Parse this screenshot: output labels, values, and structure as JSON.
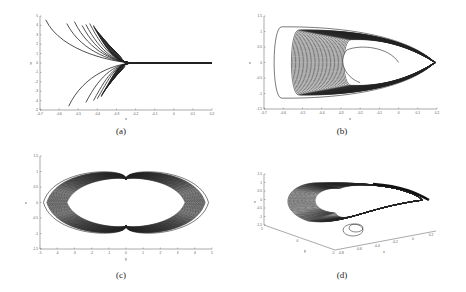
{
  "chart_data": [
    {
      "id": "a",
      "type": "line",
      "caption": "(a)",
      "title": "",
      "xlabel": "x",
      "ylabel": "y",
      "xlim": [
        -0.7,
        0.2
      ],
      "ylim": [
        -5,
        5
      ],
      "xticks": [
        "-0.7",
        "-0.6",
        "-0.5",
        "-0.4",
        "-0.3",
        "-0.2",
        "-0.1",
        "0",
        "0.1",
        "0.2"
      ],
      "yticks": [
        "5",
        "4",
        "3",
        "2",
        "1",
        "0",
        "-1",
        "-2",
        "-3",
        "-4",
        "-5"
      ],
      "grid": false,
      "description": "Family of trajectories in x-y plane converging from the left onto y=0 near x≈-0.2 and continuing flat to x=0.2",
      "series": [
        {
          "name": "upper trajectories",
          "x_start": [
            -0.67,
            -0.56,
            -0.52,
            -0.48,
            -0.46,
            -0.44,
            -0.42
          ],
          "y_start": [
            4.6,
            4.2,
            4.4,
            4.0,
            4.1,
            4.2,
            4.0
          ],
          "x_end": 0.2,
          "y_end": 0
        },
        {
          "name": "lower trajectories",
          "x_start": [
            -0.55,
            -0.46,
            -0.42,
            -0.4,
            -0.38
          ],
          "y_start": [
            -4.6,
            -4.2,
            -4.0,
            -3.8,
            -3.6
          ],
          "x_end": 0.2,
          "y_end": 0
        }
      ]
    },
    {
      "id": "b",
      "type": "line",
      "caption": "(b)",
      "title": "",
      "xlabel": "x",
      "ylabel": "z",
      "xlim": [
        -0.7,
        0.2
      ],
      "ylim": [
        -1.5,
        1.5
      ],
      "xticks": [
        "-0.7",
        "-0.6",
        "-0.5",
        "-0.4",
        "-0.3",
        "-0.2",
        "-0.1",
        "0",
        "0.1",
        "0.2"
      ],
      "yticks": [
        "1.5",
        "1",
        "0.5",
        "0",
        "-0.5",
        "-1",
        "-1.5"
      ],
      "grid": false,
      "description": "x-z projection of a chaotic attractor: nested loops extending from x≈-0.65 to tip at x≈0.2, z in [-1.1,1.1], hollow core from x≈-0.3 to 0",
      "series": [
        {
          "name": "attractor",
          "x_range": [
            -0.65,
            0.19
          ],
          "z_range": [
            -1.1,
            1.1
          ],
          "hole_x_range": [
            -0.28,
            0.0
          ]
        }
      ]
    },
    {
      "id": "c",
      "type": "line",
      "caption": "(c)",
      "title": "",
      "xlabel": "y",
      "ylabel": "z",
      "xlim": [
        -5,
        5
      ],
      "ylim": [
        -1.5,
        1.5
      ],
      "xticks": [
        "-5",
        "-4",
        "-3",
        "-2",
        "-1",
        "0",
        "1",
        "2",
        "3",
        "4",
        "5"
      ],
      "yticks": [
        "1.5",
        "1",
        "0.5",
        "0",
        "-0.5",
        "-1",
        "-1.5"
      ],
      "grid": false,
      "description": "y-z projection: double-scroll (butterfly) shape with two lobes centered near y=±2.2, spanning y in [-4.6, 4.6], z in [-1.1, 1.1], pinched at y=0",
      "series": [
        {
          "name": "left lobe",
          "y_range": [
            -4.6,
            0
          ],
          "z_range": [
            -1.1,
            1.1
          ]
        },
        {
          "name": "right lobe",
          "y_range": [
            0,
            4.6
          ],
          "z_range": [
            -1.1,
            1.1
          ]
        }
      ]
    },
    {
      "id": "d",
      "type": "line",
      "caption": "(d)",
      "title": "",
      "xlabel": "x",
      "ylabel": "y",
      "zlabel": "z",
      "projection": "3d",
      "zlim": [
        -1.5,
        1.5
      ],
      "zticks": [
        "1.5",
        "1",
        "0.5",
        "0",
        "-0.5",
        "-1",
        "-1.5"
      ],
      "yticks": [
        "5",
        "0",
        "-5"
      ],
      "xticks": [
        "-0.8",
        "-0.6",
        "-0.4",
        "-0.2",
        "0",
        "0.2"
      ],
      "grid": false,
      "description": "3D view of the chaotic attractor in x-y-z space"
    }
  ]
}
